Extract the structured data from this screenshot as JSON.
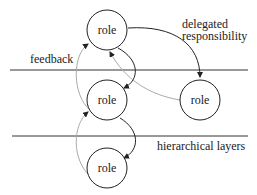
{
  "diagram": {
    "roles": [
      {
        "id": "top",
        "label": "role",
        "cx": 107,
        "cy": 30
      },
      {
        "id": "middle",
        "label": "role",
        "cx": 107,
        "cy": 100
      },
      {
        "id": "right",
        "label": "role",
        "cx": 200,
        "cy": 100
      },
      {
        "id": "bottom",
        "label": "role",
        "cx": 107,
        "cy": 168
      }
    ],
    "labels": {
      "delegated_1": "delegated",
      "delegated_2": "responsibility",
      "feedback": "feedback",
      "hierarchical": "hierarchical layers"
    },
    "colors": {
      "line": "#222222",
      "feedback": "#aaaaaa"
    }
  }
}
